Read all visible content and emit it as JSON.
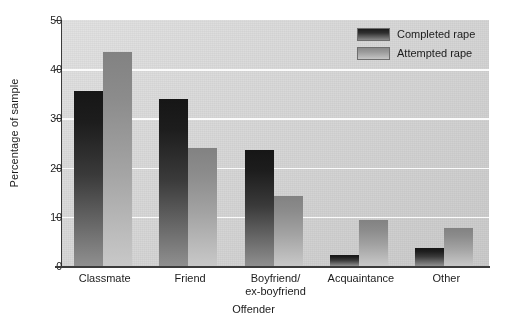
{
  "chart_data": {
    "type": "bar",
    "title": "",
    "xlabel": "Offender",
    "ylabel": "Percentage of sample",
    "categories": [
      "Classmate",
      "Friend",
      "Boyfriend/\nex-boyfriend",
      "Acquaintance",
      "Other"
    ],
    "category_lines": [
      [
        "Classmate"
      ],
      [
        "Friend"
      ],
      [
        "Boyfriend/",
        "ex-boyfriend"
      ],
      [
        "Acquaintance"
      ],
      [
        "Other"
      ]
    ],
    "series": [
      {
        "name": "Completed rape",
        "values": [
          35.5,
          34.0,
          23.5,
          2.3,
          3.6
        ],
        "color": "#2b2b2b"
      },
      {
        "name": "Attempted rape",
        "values": [
          43.5,
          24.0,
          14.2,
          9.4,
          7.7
        ],
        "color": "#a8a8a8"
      }
    ],
    "ylim": [
      0,
      50
    ],
    "yticks": [
      0,
      10,
      20,
      30,
      40,
      50
    ],
    "ytick_labels": [
      "0",
      "10",
      "20",
      "30",
      "40",
      "50"
    ],
    "grid": true,
    "grid_axis": "y",
    "grid_color": "#fbfbfb",
    "legend_position": "top-right",
    "plot_background": "#d3d3d3",
    "axis_color": "#3b3b3b",
    "text_color": "#1c1c1c"
  }
}
